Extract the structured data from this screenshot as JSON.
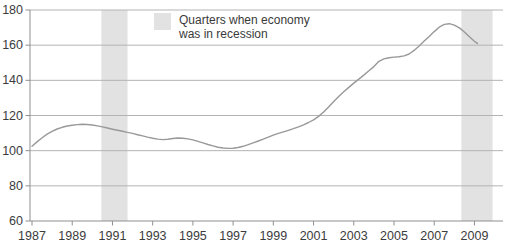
{
  "chart_data": {
    "type": "line",
    "title": "",
    "xlabel": "",
    "ylabel": "",
    "x_range": [
      1986.9,
      2010.42
    ],
    "y_range": [
      60,
      180
    ],
    "x_ticks": [
      "1987",
      "1989",
      "1991",
      "1993",
      "1995",
      "1997",
      "1999",
      "2001",
      "2003",
      "2005",
      "2007",
      "2009"
    ],
    "x_tick_years": [
      1987,
      1989,
      1991,
      1993,
      1995,
      1997,
      1999,
      2001,
      2003,
      2005,
      2007,
      2009
    ],
    "y_ticks": [
      60,
      80,
      100,
      120,
      140,
      160,
      180
    ],
    "grid": "horizontal",
    "legend": {
      "position": "top-center",
      "line1": "Quarters when economy",
      "line2": "was in recession"
    },
    "recession_bands": [
      [
        1990.45,
        1991.75
      ],
      [
        2008.35,
        2009.9
      ]
    ],
    "series": [
      {
        "name": "economic-index",
        "points": [
          [
            1987.0,
            102.5
          ],
          [
            1987.25,
            105.0
          ],
          [
            1987.5,
            107.3
          ],
          [
            1987.75,
            109.4
          ],
          [
            1988.0,
            111.0
          ],
          [
            1988.25,
            112.3
          ],
          [
            1988.5,
            113.3
          ],
          [
            1988.75,
            114.0
          ],
          [
            1989.0,
            114.5
          ],
          [
            1989.25,
            114.8
          ],
          [
            1989.5,
            115.0
          ],
          [
            1989.75,
            114.9
          ],
          [
            1990.0,
            114.6
          ],
          [
            1990.25,
            114.1
          ],
          [
            1990.5,
            113.5
          ],
          [
            1990.75,
            112.9
          ],
          [
            1991.0,
            112.2
          ],
          [
            1991.25,
            111.6
          ],
          [
            1991.5,
            111.0
          ],
          [
            1991.75,
            110.4
          ],
          [
            1992.0,
            109.8
          ],
          [
            1992.25,
            109.1
          ],
          [
            1992.5,
            108.4
          ],
          [
            1992.75,
            107.7
          ],
          [
            1993.0,
            107.1
          ],
          [
            1993.25,
            106.6
          ],
          [
            1993.5,
            106.3
          ],
          [
            1993.75,
            106.5
          ],
          [
            1994.0,
            106.9
          ],
          [
            1994.25,
            107.2
          ],
          [
            1994.5,
            107.1
          ],
          [
            1994.75,
            106.7
          ],
          [
            1995.0,
            106.1
          ],
          [
            1995.25,
            105.3
          ],
          [
            1995.5,
            104.4
          ],
          [
            1995.75,
            103.5
          ],
          [
            1996.0,
            102.7
          ],
          [
            1996.25,
            102.0
          ],
          [
            1996.5,
            101.5
          ],
          [
            1996.75,
            101.3
          ],
          [
            1997.0,
            101.4
          ],
          [
            1997.25,
            101.8
          ],
          [
            1997.5,
            102.5
          ],
          [
            1997.75,
            103.4
          ],
          [
            1998.0,
            104.4
          ],
          [
            1998.25,
            105.5
          ],
          [
            1998.5,
            106.6
          ],
          [
            1998.75,
            107.7
          ],
          [
            1999.0,
            108.8
          ],
          [
            1999.25,
            109.8
          ],
          [
            1999.5,
            110.7
          ],
          [
            1999.75,
            111.6
          ],
          [
            2000.0,
            112.5
          ],
          [
            2000.25,
            113.5
          ],
          [
            2000.5,
            114.7
          ],
          [
            2000.75,
            116.0
          ],
          [
            2001.0,
            117.5
          ],
          [
            2001.25,
            119.5
          ],
          [
            2001.5,
            122.0
          ],
          [
            2001.75,
            124.9
          ],
          [
            2002.0,
            128.0
          ],
          [
            2002.25,
            130.8
          ],
          [
            2002.5,
            133.5
          ],
          [
            2002.75,
            136.0
          ],
          [
            2003.0,
            138.4
          ],
          [
            2003.25,
            140.7
          ],
          [
            2003.5,
            143.0
          ],
          [
            2003.75,
            145.4
          ],
          [
            2004.0,
            147.8
          ],
          [
            2004.25,
            150.8
          ],
          [
            2004.5,
            152.2
          ],
          [
            2004.75,
            152.9
          ],
          [
            2005.0,
            153.2
          ],
          [
            2005.25,
            153.4
          ],
          [
            2005.5,
            153.9
          ],
          [
            2005.75,
            155.0
          ],
          [
            2006.0,
            157.0
          ],
          [
            2006.25,
            159.6
          ],
          [
            2006.5,
            162.3
          ],
          [
            2006.75,
            165.0
          ],
          [
            2007.0,
            167.7
          ],
          [
            2007.25,
            170.2
          ],
          [
            2007.5,
            171.8
          ],
          [
            2007.75,
            172.2
          ],
          [
            2008.0,
            171.4
          ],
          [
            2008.25,
            169.8
          ],
          [
            2008.5,
            167.5
          ],
          [
            2008.75,
            164.8
          ],
          [
            2009.0,
            162.2
          ],
          [
            2009.15,
            161.0
          ]
        ]
      }
    ],
    "colors": {
      "band": "#e2e2e2",
      "grid": "#b3b3b3",
      "axis": "#8f8f8f",
      "line": "#999999",
      "text": "#3c3c3c"
    }
  }
}
